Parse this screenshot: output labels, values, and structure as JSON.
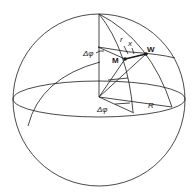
{
  "figure": {
    "labels": {
      "delta_phi_upper": "Δφ",
      "delta_phi_lower": "Δφ",
      "point_m": "M",
      "point_w": "W",
      "r": "r",
      "x": "x",
      "radius": "R"
    }
  }
}
